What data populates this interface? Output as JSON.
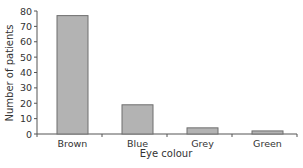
{
  "chart_data": {
    "type": "bar",
    "title": "",
    "xlabel": "Eye colour",
    "ylabel": "Number of patients",
    "categories": [
      "Brown",
      "Blue",
      "Grey",
      "Green"
    ],
    "values": [
      77,
      19,
      4,
      2
    ],
    "ylim": [
      0,
      80
    ],
    "yticks": [
      0,
      10,
      20,
      30,
      40,
      50,
      60,
      70,
      80
    ],
    "grid": false,
    "legend": null,
    "colors": {
      "bar_fill": "#b3b3b3",
      "bar_stroke": "#6e6e6e",
      "axis": "#555555"
    }
  }
}
